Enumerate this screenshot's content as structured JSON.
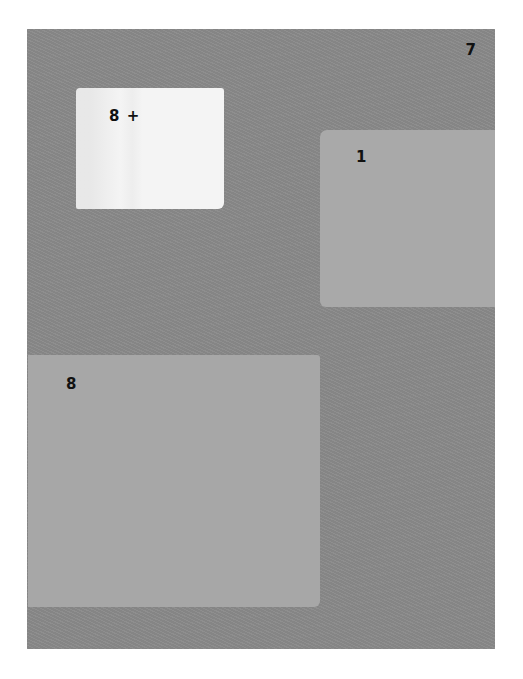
{
  "panel": {
    "corner_label": "7",
    "background_color": "#8a8a8a"
  },
  "patches": [
    {
      "label": "8 +",
      "color": "#f4f4f4"
    },
    {
      "label": "1",
      "color": "#a9a9a9"
    },
    {
      "label": "8",
      "color": "#a7a7a7"
    }
  ]
}
